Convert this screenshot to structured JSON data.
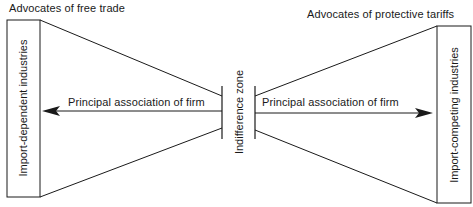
{
  "diagram": {
    "left_heading": "Advocates of free trade",
    "right_heading": "Advocates of protective tariffs",
    "left_box_label": "Import-dependent industries",
    "right_box_label": "Import-competing industries",
    "center_label": "Indifference zone",
    "left_arrow_label": "Principal association of firm",
    "right_arrow_label": "Principal association of firm",
    "line_color": "#1a1a1a",
    "background": "#ffffff"
  }
}
